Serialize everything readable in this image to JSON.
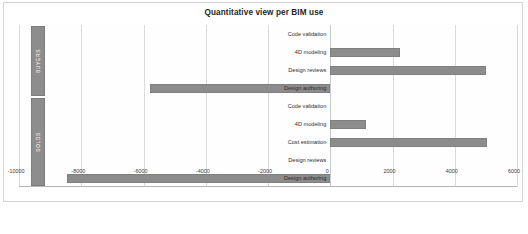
{
  "chart": {
    "title": "Quantitative view per BIM use",
    "frame_border_color": "#d4d4d4",
    "bar_color": "#8c8c8c",
    "grid_color": "#d9d9d9"
  },
  "chart_data": {
    "type": "bar",
    "orientation": "horizontal",
    "title": "Quantitative view per BIM use",
    "xlabel": "",
    "ylabel": "",
    "xlim": [
      -10000,
      6000
    ],
    "grid": true,
    "legend": "none",
    "xticks": [
      -10000,
      -8000,
      -6000,
      -4000,
      -2000,
      0,
      2000,
      4000,
      6000
    ],
    "xtick_labels": [
      "-10000",
      "-8000",
      "-6000",
      "-4000",
      "-2000",
      "0",
      "2000",
      "4000",
      "6000"
    ],
    "groups": [
      {
        "name": "BUYERS",
        "categories": [
          "Code validation",
          "4D modeling",
          "Design reviews",
          "Design authoring"
        ],
        "values": [
          0,
          2250,
          5000,
          -5800
        ]
      },
      {
        "name": "SOLDS",
        "categories": [
          "Code validation",
          "4D modeling",
          "Cost estimation",
          "Design reviews",
          "Design authoring"
        ],
        "values": [
          0,
          1150,
          5050,
          0,
          -8450
        ]
      }
    ]
  },
  "ticks": [
    {
      "label": "-10000",
      "value": -10000
    },
    {
      "label": "-8000",
      "value": -8000
    },
    {
      "label": "-6000",
      "value": -6000
    },
    {
      "label": "-4000",
      "value": -4000
    },
    {
      "label": "-2000",
      "value": -2000
    },
    {
      "label": "0",
      "value": 0
    },
    {
      "label": "2000",
      "value": 2000
    },
    {
      "label": "4000",
      "value": 4000
    },
    {
      "label": "6000",
      "value": 6000
    }
  ],
  "groups": [
    {
      "label": "BUYERS"
    },
    {
      "label": "SOLDS"
    }
  ],
  "rows": [
    {
      "label": "Code validation",
      "value": 0,
      "group": 0
    },
    {
      "label": "4D modeling",
      "value": 2250,
      "group": 0
    },
    {
      "label": "Design reviews",
      "value": 5000,
      "group": 0
    },
    {
      "label": "Design authoring",
      "value": -5800,
      "group": 0
    },
    {
      "label": "Code validation",
      "value": 0,
      "group": 1
    },
    {
      "label": "4D modeling",
      "value": 1150,
      "group": 1
    },
    {
      "label": "Cost estimation",
      "value": 5050,
      "group": 1
    },
    {
      "label": "Design reviews",
      "value": 0,
      "group": 1
    },
    {
      "label": "Design authoring",
      "value": -8450,
      "group": 1
    }
  ]
}
